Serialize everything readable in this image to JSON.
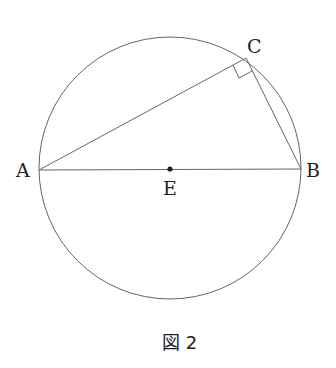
{
  "figure": {
    "caption": "図 2",
    "points": {
      "A": "A",
      "B": "B",
      "C": "C",
      "E": "E"
    },
    "elements": [
      "circle centered at E",
      "diameter AB",
      "chord AC",
      "chord CB",
      "right angle mark at C"
    ],
    "colors": {
      "stroke": "#555555",
      "text": "#222222"
    }
  }
}
